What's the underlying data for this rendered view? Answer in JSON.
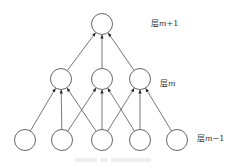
{
  "diagram": {
    "type": "layered-network",
    "layers": [
      {
        "id": "layer-m-plus-1",
        "label_prefix": "层",
        "label_var": "m+1",
        "nodes": [
          {
            "cx": 102,
            "cy": 24
          }
        ]
      },
      {
        "id": "layer-m",
        "label_prefix": "层",
        "label_var": "m",
        "nodes": [
          {
            "cx": 61,
            "cy": 79
          },
          {
            "cx": 102,
            "cy": 79
          },
          {
            "cx": 140,
            "cy": 79
          }
        ]
      },
      {
        "id": "layer-m-minus-1",
        "label_prefix": "层",
        "label_var": "m−1",
        "nodes": [
          {
            "cx": 25,
            "cy": 140
          },
          {
            "cx": 62,
            "cy": 140
          },
          {
            "cx": 102,
            "cy": 140
          },
          {
            "cx": 140,
            "cy": 140
          },
          {
            "cx": 177,
            "cy": 140
          }
        ]
      }
    ],
    "edges": [
      {
        "from": "m-1:0",
        "to": "m:0"
      },
      {
        "from": "m-1:1",
        "to": "m:0"
      },
      {
        "from": "m-1:2",
        "to": "m:0"
      },
      {
        "from": "m-1:1",
        "to": "m:1"
      },
      {
        "from": "m-1:2",
        "to": "m:1"
      },
      {
        "from": "m-1:3",
        "to": "m:1"
      },
      {
        "from": "m-1:2",
        "to": "m:2"
      },
      {
        "from": "m-1:3",
        "to": "m:2"
      },
      {
        "from": "m-1:4",
        "to": "m:2"
      },
      {
        "from": "m:0",
        "to": "m+1:0"
      },
      {
        "from": "m:1",
        "to": "m+1:0"
      },
      {
        "from": "m:2",
        "to": "m+1:0"
      }
    ],
    "node_radius": 10.5,
    "colors": {
      "stroke": "#555555",
      "arrow": "#222222",
      "text": "#333333"
    }
  },
  "labels": {
    "top": {
      "prefix": "层",
      "var": "m",
      "suffix": "+1"
    },
    "middle": {
      "prefix": "层",
      "var": "m",
      "suffix": ""
    },
    "bottom": {
      "prefix": "层",
      "var": "m",
      "suffix": "−1"
    }
  }
}
